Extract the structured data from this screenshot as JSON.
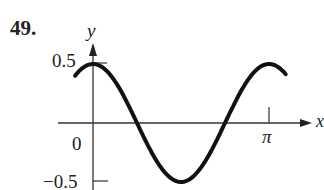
{
  "problem_number": "49.",
  "chart_data": {
    "type": "line",
    "title": "",
    "function": "y = 0.5 cos(2x)",
    "xlabel": "x",
    "ylabel": "y",
    "x_ticks": [
      {
        "value": 3.14159,
        "label": "π"
      }
    ],
    "y_ticks": [
      {
        "value": 0.5,
        "label": "0.5"
      },
      {
        "value": 0,
        "label": "0"
      },
      {
        "value": -0.5,
        "label": "−0.5"
      }
    ],
    "xlim": [
      -0.32,
      3.45
    ],
    "ylim": [
      -0.55,
      0.6
    ],
    "grid": false,
    "series": [
      {
        "name": "curve",
        "x": [
          -0.32,
          0,
          0.3927,
          0.7854,
          1.1781,
          1.5708,
          1.9635,
          2.3562,
          2.7489,
          3.1416,
          3.44
        ],
        "values": [
          0.4,
          0.5,
          0.354,
          0,
          -0.354,
          -0.5,
          -0.354,
          0,
          0.354,
          0.5,
          0.41
        ]
      }
    ]
  },
  "labels": {
    "y_axis": "y",
    "x_axis": "x",
    "tick_half": "0.5",
    "tick_zero": "0",
    "tick_neg_half": "−0.5",
    "tick_pi": "π"
  }
}
